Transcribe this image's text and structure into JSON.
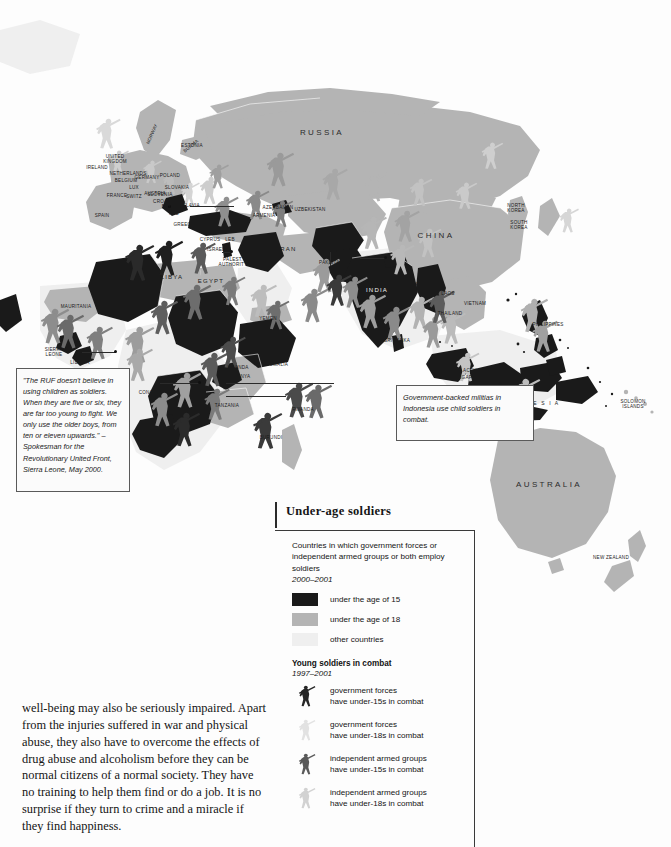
{
  "legend": {
    "title": "Under-age soldiers",
    "description": "Countries in which government forces or independent armed groups or both employ soldiers",
    "description_years": "2000–2001",
    "swatches": [
      {
        "label": "under the age of 15",
        "color": "#1a1a1a"
      },
      {
        "label": "under the age of 18",
        "color": "#b4b4b4"
      },
      {
        "label": "other countries",
        "color": "#efefef"
      }
    ],
    "subtitle": "Young soldiers in combat",
    "subtitle_years": "1997–2001",
    "figures": [
      {
        "line1": "government forces",
        "line2": "have under-15s in combat",
        "color": "#262626"
      },
      {
        "line1": "government forces",
        "line2": "have under-18s in combat",
        "color": "#e2e2e2"
      },
      {
        "line1": "independent armed groups",
        "line2": "have under-15s in combat",
        "color": "#5a5a5a"
      },
      {
        "line1": "independent armed groups",
        "line2": "have under-18s in combat",
        "color": "#d2d2d2"
      }
    ]
  },
  "callouts": {
    "quote": "\"The RUF doesn't believe in using children as soldiers. When they are five or six, they are far too young to fight. We only use the older boys, from ten or eleven upwards.\" – Spokesman for the Revolutionary United Front, Sierra Leone, May 2000.",
    "indonesia": "Government-backed militias in Indonesia use child soldiers in combat."
  },
  "prose": "well-being may also be seriously impaired. Apart from the injuries suffered in war and physical abuse, they also have to overcome the effects of drug abuse and alcoholism before they can be normal citizens of a normal society. They have no training to help them find or do a job. It is no surprise if they turn to crime and a miracle if they find happiness.",
  "map": {
    "labels": [
      {
        "text": "RUSSIA",
        "x": 322,
        "y": 133,
        "cls": "big"
      },
      {
        "text": "CHINA",
        "x": 436,
        "y": 236,
        "cls": "big"
      },
      {
        "text": "INDIA",
        "x": 377,
        "y": 290,
        "cls": "mid lt"
      },
      {
        "text": "AUSTRALIA",
        "x": 549,
        "y": 485,
        "cls": "big"
      },
      {
        "text": "I N D O N E S I A",
        "x": 527,
        "y": 404,
        "cls": "wide"
      },
      {
        "text": "NEW ZEALAND",
        "x": 611,
        "y": 558,
        "cls": ""
      },
      {
        "text": "NORWAY",
        "x": 152,
        "y": 134,
        "cls": "rot"
      },
      {
        "text": "IRELAND",
        "x": 97,
        "y": 168,
        "cls": ""
      },
      {
        "text": "UNITED\nKINGDOM",
        "x": 115,
        "y": 159,
        "cls": ""
      },
      {
        "text": "NETHERLANDS",
        "x": 128,
        "y": 174,
        "cls": ""
      },
      {
        "text": "BELGIUM",
        "x": 126,
        "y": 181,
        "cls": ""
      },
      {
        "text": "LUX",
        "x": 134,
        "y": 188,
        "cls": ""
      },
      {
        "text": "FRANCE",
        "x": 117,
        "y": 196,
        "cls": ""
      },
      {
        "text": "SWITZ",
        "x": 134,
        "y": 197,
        "cls": ""
      },
      {
        "text": "SPAIN",
        "x": 102,
        "y": 216,
        "cls": ""
      },
      {
        "text": "GERMANY",
        "x": 147,
        "y": 178,
        "cls": ""
      },
      {
        "text": "POLAND",
        "x": 170,
        "y": 176,
        "cls": ""
      },
      {
        "text": "SLOVAKIA",
        "x": 177,
        "y": 188,
        "cls": ""
      },
      {
        "text": "AUSTRIA",
        "x": 155,
        "y": 194,
        "cls": ""
      },
      {
        "text": "SLOVENIA",
        "x": 160,
        "y": 195,
        "cls": ""
      },
      {
        "text": "CROATIA",
        "x": 164,
        "y": 202,
        "cls": ""
      },
      {
        "text": "B-H",
        "x": 166,
        "y": 207,
        "cls": ""
      },
      {
        "text": "YUGOSLAVIA",
        "x": 184,
        "y": 206,
        "cls": ""
      },
      {
        "text": "ALB",
        "x": 174,
        "y": 214,
        "cls": ""
      },
      {
        "text": "GREECE",
        "x": 184,
        "y": 225,
        "cls": ""
      },
      {
        "text": "ESTONIA",
        "x": 192,
        "y": 146,
        "cls": ""
      },
      {
        "text": "CYPRUS",
        "x": 210,
        "y": 240,
        "cls": ""
      },
      {
        "text": "LEB",
        "x": 230,
        "y": 240,
        "cls": ""
      },
      {
        "text": "ISRAEL",
        "x": 216,
        "y": 250,
        "cls": ""
      },
      {
        "text": "PALEST.\nAUTHORITY",
        "x": 233,
        "y": 262,
        "cls": ""
      },
      {
        "text": "LIBYA",
        "x": 172,
        "y": 277,
        "cls": "mid"
      },
      {
        "text": "EGYPT",
        "x": 211,
        "y": 281,
        "cls": "mid"
      },
      {
        "text": "MAURITANIA",
        "x": 76,
        "y": 307,
        "cls": ""
      },
      {
        "text": "SIERRA\nLEONE",
        "x": 54,
        "y": 352,
        "cls": ""
      },
      {
        "text": "LIBERIA",
        "x": 80,
        "y": 363,
        "cls": ""
      },
      {
        "text": "CONGO",
        "x": 148,
        "y": 393,
        "cls": ""
      },
      {
        "text": "YEMEN",
        "x": 268,
        "y": 319,
        "cls": ""
      },
      {
        "text": "UGANDA",
        "x": 238,
        "y": 368,
        "cls": ""
      },
      {
        "text": "KENYA",
        "x": 242,
        "y": 377,
        "cls": ""
      },
      {
        "text": "SOMALIA",
        "x": 277,
        "y": 365,
        "cls": ""
      },
      {
        "text": "TANZANIA",
        "x": 227,
        "y": 406,
        "cls": ""
      },
      {
        "text": "RWANDA",
        "x": 303,
        "y": 410,
        "cls": ""
      },
      {
        "text": "BURUNDI",
        "x": 271,
        "y": 438,
        "cls": ""
      },
      {
        "text": "AZERBAIJAN",
        "x": 278,
        "y": 208,
        "cls": ""
      },
      {
        "text": "ARMENIA",
        "x": 264,
        "y": 216,
        "cls": ""
      },
      {
        "text": "UZBEKISTAN",
        "x": 310,
        "y": 210,
        "cls": ""
      },
      {
        "text": "IRAN",
        "x": 287,
        "y": 249,
        "cls": "mid"
      },
      {
        "text": "PAKISTAN",
        "x": 331,
        "y": 263,
        "cls": ""
      },
      {
        "text": "NEPAL",
        "x": 385,
        "y": 266,
        "cls": ""
      },
      {
        "text": "MYANMAR",
        "x": 410,
        "y": 285,
        "cls": ""
      },
      {
        "text": "SRI LANKA",
        "x": 397,
        "y": 341,
        "cls": ""
      },
      {
        "text": "LAOS",
        "x": 448,
        "y": 294,
        "cls": ""
      },
      {
        "text": "VIETNAM",
        "x": 475,
        "y": 304,
        "cls": ""
      },
      {
        "text": "THAILAND",
        "x": 450,
        "y": 314,
        "cls": ""
      },
      {
        "text": "PHILIPPINES",
        "x": 548,
        "y": 325,
        "cls": ""
      },
      {
        "text": "SINGAPORE",
        "x": 468,
        "y": 378,
        "cls": ""
      },
      {
        "text": "ACEH",
        "x": 470,
        "y": 371,
        "cls": ""
      },
      {
        "text": "NORTH\nKOREA",
        "x": 516,
        "y": 208,
        "cls": ""
      },
      {
        "text": "SOUTH\nKOREA",
        "x": 519,
        "y": 225,
        "cls": ""
      },
      {
        "text": "SOLOMON\nISLANDS",
        "x": 633,
        "y": 404,
        "cls": ""
      },
      {
        "text": "BURMA",
        "x": 191,
        "y": 146,
        "cls": "rot2"
      }
    ]
  }
}
